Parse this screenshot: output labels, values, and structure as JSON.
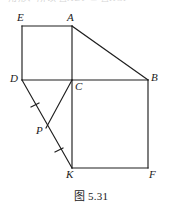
{
  "figure": {
    "caption": "图 5.31",
    "page_bleed_text": "角形、所以 △ADP ≌ △KCP",
    "canvas": {
      "width": 182,
      "height": 212
    },
    "points": [
      {
        "id": "E",
        "label": "E",
        "x": 22,
        "y": 26,
        "label_x": 17,
        "label_y": 12
      },
      {
        "id": "A",
        "label": "A",
        "x": 72,
        "y": 26,
        "label_x": 67,
        "label_y": 12
      },
      {
        "id": "D",
        "label": "D",
        "x": 22,
        "y": 80,
        "label_x": 10,
        "label_y": 73
      },
      {
        "id": "C",
        "label": "C",
        "x": 72,
        "y": 80,
        "label_x": 75,
        "label_y": 81
      },
      {
        "id": "B",
        "label": "B",
        "x": 148,
        "y": 80,
        "label_x": 151,
        "label_y": 72
      },
      {
        "id": "P",
        "label": "P",
        "x": 46,
        "y": 128,
        "label_x": 36,
        "label_y": 125
      },
      {
        "id": "K",
        "label": "K",
        "x": 72,
        "y": 168,
        "label_x": 66,
        "label_y": 169
      },
      {
        "id": "F",
        "label": "F",
        "x": 148,
        "y": 168,
        "label_x": 149,
        "label_y": 169
      }
    ],
    "segments": [
      {
        "name": "segment-E-A",
        "from": "E",
        "to": "A",
        "x1": 22,
        "y1": 26,
        "x2": 72,
        "y2": 26
      },
      {
        "name": "segment-E-D",
        "from": "E",
        "to": "D",
        "x1": 22,
        "y1": 26,
        "x2": 22,
        "y2": 80
      },
      {
        "name": "segment-A-C",
        "from": "A",
        "to": "C",
        "x1": 72,
        "y1": 26,
        "x2": 72,
        "y2": 80
      },
      {
        "name": "segment-A-B",
        "from": "A",
        "to": "B",
        "x1": 72,
        "y1": 26,
        "x2": 148,
        "y2": 80
      },
      {
        "name": "segment-D-B",
        "from": "D",
        "to": "B",
        "x1": 22,
        "y1": 80,
        "x2": 148,
        "y2": 80
      },
      {
        "name": "segment-D-K",
        "from": "D",
        "to": "K",
        "x1": 22,
        "y1": 80,
        "x2": 72,
        "y2": 168
      },
      {
        "name": "segment-C-P",
        "from": "C",
        "to": "P",
        "x1": 72,
        "y1": 80,
        "x2": 46,
        "y2": 128
      },
      {
        "name": "segment-C-K",
        "from": "C",
        "to": "K",
        "x1": 72,
        "y1": 80,
        "x2": 72,
        "y2": 168
      },
      {
        "name": "segment-B-F",
        "from": "B",
        "to": "F",
        "x1": 148,
        "y1": 80,
        "x2": 148,
        "y2": 168
      },
      {
        "name": "segment-K-F",
        "from": "K",
        "to": "F",
        "x1": 72,
        "y1": 168,
        "x2": 148,
        "y2": 168
      }
    ],
    "tick_marks": [
      {
        "name": "tick-on-DP",
        "on_segment": "segment-D-P",
        "x1": 31,
        "y1": 107,
        "x2": 39,
        "y2": 103
      },
      {
        "name": "tick-on-PK",
        "on_segment": "segment-P-K",
        "x1": 55,
        "y1": 152,
        "x2": 63,
        "y2": 148
      }
    ],
    "colors": {
      "stroke": "#1f1f1f",
      "background": "#ffffff",
      "label": "#1a1a1a"
    }
  }
}
